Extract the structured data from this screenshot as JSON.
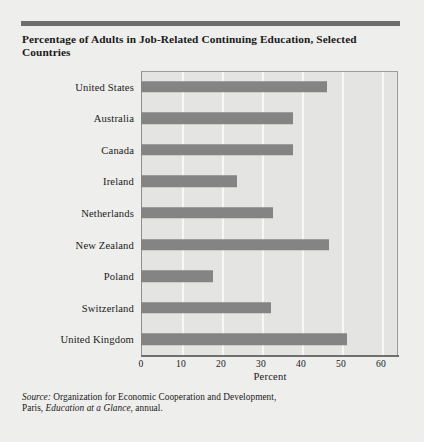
{
  "figure": {
    "title": "Percentage of Adults in Job-Related Continuing Education, Selected Countries",
    "source_prefix": "Source:",
    "source_text_1": " Organization for Economic Cooperation and Development,",
    "source_text_2": "Paris, ",
    "source_italic": "Education at a Glance",
    "source_text_3": ", annual.",
    "accent_color": "#6e6e6e",
    "bar_color": "#848484",
    "plot_background": "#e4e4e3",
    "page_background": "#eeeeed",
    "gridline_color": "#f7f7f6"
  },
  "chart_data": {
    "type": "bar",
    "orientation": "horizontal",
    "title": "Percentage of Adults in Job-Related Continuing Education, Selected Countries",
    "xlabel": "Percent",
    "ylabel": "",
    "xlim": [
      0,
      62
    ],
    "ylim": [
      0,
      9
    ],
    "grid": true,
    "legend": false,
    "xticks": [
      0,
      10,
      20,
      30,
      40,
      50,
      60
    ],
    "xtick_labels": [
      "0",
      "10",
      "20",
      "30",
      "40",
      "50",
      "60"
    ],
    "categories": [
      "United States",
      "Australia",
      "Canada",
      "Ireland",
      "Netherlands",
      "New Zealand",
      "Poland",
      "Switzerland",
      "United Kingdom"
    ],
    "values": [
      46.5,
      38,
      38,
      24,
      33,
      47,
      18,
      32.5,
      51.5
    ],
    "series": [
      {
        "name": "Percentage of adults in job-related continuing education",
        "values": [
          46.5,
          38,
          38,
          24,
          33,
          47,
          18,
          32.5,
          51.5
        ]
      }
    ]
  }
}
